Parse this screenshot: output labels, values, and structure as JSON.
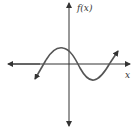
{
  "figure": {
    "y_axis_label": "f(x)",
    "x_axis_label": "x",
    "colors": {
      "axis": "#333333",
      "curve": "#555555",
      "background": "#ffffff"
    }
  }
}
